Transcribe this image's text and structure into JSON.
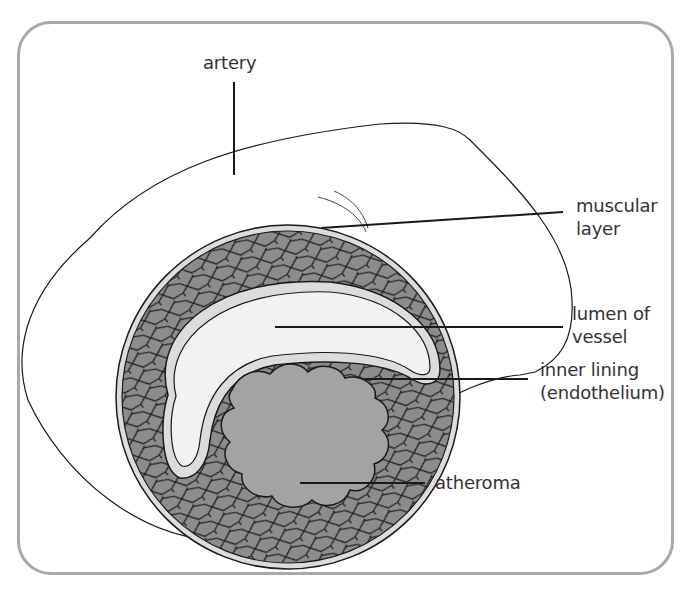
{
  "diagram": {
    "labels": {
      "artery": "artery",
      "muscular_layer_line1": "muscular",
      "muscular_layer_line2": "layer",
      "lumen_line1": "lumen of",
      "lumen_line2": "vessel",
      "inner_lining_line1": "inner lining",
      "inner_lining_line2": "(endothelium)",
      "atheroma": "atheroma"
    },
    "colors": {
      "frame": "#a9a9a9",
      "muscle": "#8c8c8c",
      "lumen": "#f2f2f2",
      "lining": "#dcdcdc",
      "atheroma": "#a3a3a3",
      "outline": "#1a1a1a",
      "text": "#333333"
    }
  }
}
